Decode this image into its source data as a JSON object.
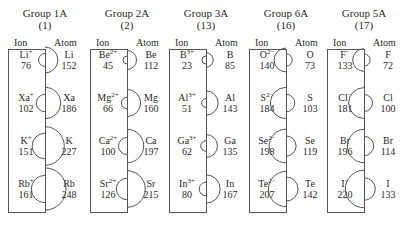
{
  "diagram": {
    "column_headers": {
      "ion": "Ion",
      "atom": "Atom"
    },
    "groups": [
      {
        "title": "Group  1A",
        "number": "(1)",
        "x": 4,
        "rows": [
          {
            "ion": "Li",
            "charge": "+",
            "ion_radius": "76",
            "atom": "Li",
            "atom_radius": "152"
          },
          {
            "ion": "Xa",
            "charge": "+",
            "ion_radius": "102",
            "atom": "Xa",
            "atom_radius": "186"
          },
          {
            "ion": "K",
            "charge": "+",
            "ion_radius": "151",
            "atom": "K",
            "atom_radius": "227"
          },
          {
            "ion": "Rb",
            "charge": "+",
            "ion_radius": "161",
            "atom": "Rb",
            "atom_radius": "248"
          }
        ]
      },
      {
        "title": "Group  2A",
        "number": "(2)",
        "x": 86,
        "rows": [
          {
            "ion": "Be",
            "charge": "2+",
            "ion_radius": "45",
            "atom": "Be",
            "atom_radius": "112"
          },
          {
            "ion": "Mg",
            "charge": "2+",
            "ion_radius": "66",
            "atom": "Mg",
            "atom_radius": "160"
          },
          {
            "ion": "Ca",
            "charge": "2+",
            "ion_radius": "100",
            "atom": "Ca",
            "atom_radius": "197"
          },
          {
            "ion": "Sr",
            "charge": "2+",
            "ion_radius": "126",
            "atom": "Sr",
            "atom_radius": "215"
          }
        ]
      },
      {
        "title": "Group  3A",
        "number": "(13)",
        "x": 165,
        "rows": [
          {
            "ion": "B",
            "charge": "3+",
            "ion_radius": "23",
            "atom": "B",
            "atom_radius": "85"
          },
          {
            "ion": "Al",
            "charge": "3+",
            "ion_radius": "51",
            "atom": "Al",
            "atom_radius": "143"
          },
          {
            "ion": "Ga",
            "charge": "3+",
            "ion_radius": "62",
            "atom": "Ga",
            "atom_radius": "135"
          },
          {
            "ion": "In",
            "charge": "3+",
            "ion_radius": "80",
            "atom": "In",
            "atom_radius": "167"
          }
        ]
      },
      {
        "title": "Group  6A",
        "number": "(16)",
        "x": 245,
        "rows": [
          {
            "ion": "O",
            "charge": "2−",
            "ion_radius": "140",
            "atom": "O",
            "atom_radius": "73"
          },
          {
            "ion": "S",
            "charge": "2−",
            "ion_radius": "184",
            "atom": "S",
            "atom_radius": "103"
          },
          {
            "ion": "Se",
            "charge": "2−",
            "ion_radius": "198",
            "atom": "Se",
            "atom_radius": "119"
          },
          {
            "ion": "Te",
            "charge": "2−",
            "ion_radius": "207",
            "atom": "Te",
            "atom_radius": "142"
          }
        ]
      },
      {
        "title": "Group  5A",
        "number": "(17)",
        "x": 323,
        "rows": [
          {
            "ion": "F",
            "charge": "−",
            "ion_radius": "133",
            "atom": "F",
            "atom_radius": "72"
          },
          {
            "ion": "Cl",
            "charge": "−",
            "ion_radius": "181",
            "atom": "Cl",
            "atom_radius": "100"
          },
          {
            "ion": "Br",
            "charge": "",
            "ion_radius": "196",
            "atom": "Br",
            "atom_radius": "114"
          },
          {
            "ion": "I",
            "charge": "−",
            "ion_radius": "220",
            "atom": "I",
            "atom_radius": "133"
          }
        ]
      }
    ]
  }
}
